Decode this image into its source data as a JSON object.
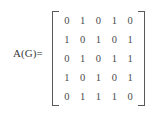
{
  "equation": {
    "label": "A(G)=",
    "bracket_color": "#58585a",
    "digit_color": "#4a4a4c",
    "background_color": "#ffffff"
  },
  "chart_data": {
    "type": "table",
    "title": "A(G)=",
    "xlabel": "",
    "ylabel": "",
    "rows": [
      [
        "0",
        "1",
        "0",
        "1",
        "0"
      ],
      [
        "1",
        "0",
        "1",
        "0",
        "1"
      ],
      [
        "0",
        "1",
        "0",
        "1",
        "1"
      ],
      [
        "1",
        "0",
        "1",
        "0",
        "1"
      ],
      [
        "0",
        "1",
        "1",
        "1",
        "0"
      ]
    ]
  }
}
